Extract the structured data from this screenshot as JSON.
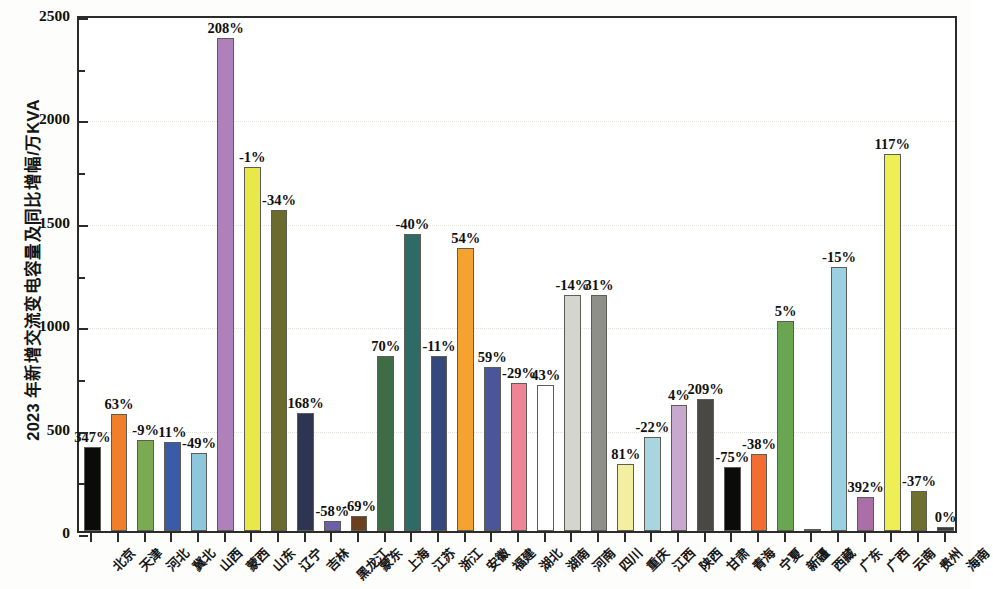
{
  "chart_data": {
    "type": "bar",
    "title": "",
    "subtitle": "",
    "xlabel": "",
    "ylabel": "2023 年新增交流变电容量及同比增幅/万KVA",
    "ylim": [
      0,
      2500
    ],
    "y_major_ticks": [
      0,
      500,
      1000,
      1500,
      2000,
      2500
    ],
    "y_minor_ticks": [
      250,
      750,
      1250,
      1750,
      2250
    ],
    "y_tick_labels": [
      "0",
      "500",
      "1000",
      "1500",
      "2000",
      "2500"
    ],
    "grid": true,
    "legend": "none",
    "categories": [
      "北京",
      "天津",
      "河北",
      "冀北",
      "山西",
      "蒙西",
      "山东",
      "辽宁",
      "吉林",
      "黑龙江",
      "蒙东",
      "上海",
      "江苏",
      "浙江",
      "安徽",
      "福建",
      "湖北",
      "湖南",
      "河南",
      "四川",
      "重庆",
      "江西",
      "陕西",
      "甘肃",
      "青海",
      "宁夏",
      "新疆",
      "西藏",
      "广东",
      "广西",
      "云南",
      "贵州",
      "海南"
    ],
    "values": [
      405,
      565,
      440,
      430,
      375,
      2385,
      1758,
      1550,
      570,
      50,
      75,
      845,
      1435,
      845,
      1368,
      795,
      715,
      705,
      1143,
      1140,
      325,
      455,
      610,
      640,
      310,
      370,
      1015,
      12,
      1278,
      165,
      1825,
      195,
      20
    ],
    "data_labels": [
      "347%",
      "63%",
      "-9%",
      "11%",
      "-49%",
      "208%",
      "-1%",
      "-34%",
      "168%",
      "-58%",
      "-69%",
      "70%",
      "-40%",
      "-11%",
      "54%",
      "59%",
      "-29%",
      "43%",
      "-14%",
      "31%",
      "81%",
      "-22%",
      "4%",
      "209%",
      "-75%",
      "-38%",
      "5%",
      "",
      "-15%",
      "392%",
      "117%",
      "-37%",
      "0%"
    ],
    "bar_colors": [
      "#0b0b0b",
      "#f07f2c",
      "#7aab52",
      "#3a5ba8",
      "#8cc7db",
      "#ae81bb",
      "#e8e84a",
      "#6b6b2e",
      "#2e3552",
      "#6a61a8",
      "#6b4020",
      "#3f6b47",
      "#2f6b66",
      "#33497e",
      "#f5a32e",
      "#4a5699",
      "#ee8594",
      "#ffffff",
      "#d5d5d0",
      "#8f8f8a",
      "#f2f0a0",
      "#a8d5e0",
      "#c8a8cc",
      "#494844",
      "#0b0b0b",
      "#f26d32",
      "#6aa552",
      "#2f3340",
      "#9bd0e2",
      "#ab6fa8",
      "#eeee55",
      "#6f7030",
      "#3a3a42"
    ],
    "series": [
      {
        "name": "2023年新增交流变电容量/万KVA",
        "values": [
          405,
          565,
          440,
          430,
          375,
          2385,
          1758,
          1550,
          570,
          50,
          75,
          845,
          1435,
          845,
          1368,
          795,
          715,
          705,
          1143,
          1140,
          325,
          455,
          610,
          640,
          310,
          370,
          1015,
          12,
          1278,
          165,
          1825,
          195,
          20
        ]
      },
      {
        "name": "同比增幅",
        "values": [
          347,
          63,
          -9,
          11,
          -49,
          208,
          -1,
          -34,
          168,
          -58,
          -69,
          70,
          -40,
          -11,
          54,
          59,
          -29,
          43,
          -14,
          31,
          81,
          -22,
          4,
          209,
          -75,
          -38,
          5,
          null,
          -15,
          392,
          117,
          -37,
          0
        ]
      }
    ]
  }
}
